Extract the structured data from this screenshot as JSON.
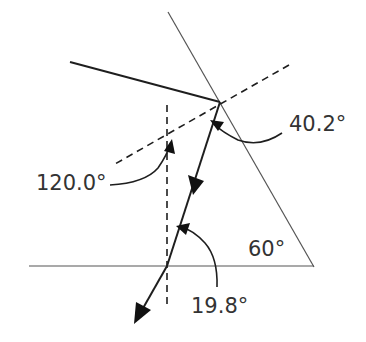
{
  "diagram": {
    "type": "prism refraction ray diagram",
    "labels": {
      "angle_exit": "40.2°",
      "angle_incidence_internal": "120.0°",
      "angle_prism": "60°",
      "angle_entry": "19.8°"
    },
    "colors": {
      "line": "#2a2a2a",
      "prism_edge": "#555555",
      "text": "#333333",
      "background": "#ffffff"
    }
  }
}
